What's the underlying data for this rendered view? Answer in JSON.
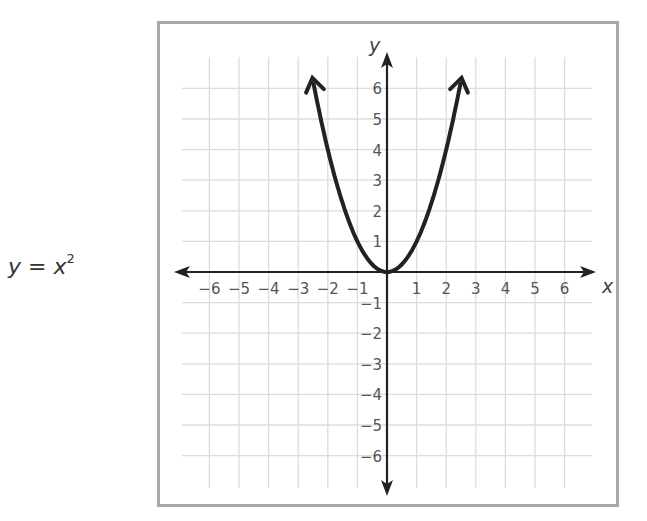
{
  "equation": {
    "lhs": "y",
    "eq": " = ",
    "rhs": "x",
    "exp": "2"
  },
  "chart_data": {
    "type": "line",
    "xlabel": "x",
    "ylabel": "y",
    "xlim": [
      -6,
      6
    ],
    "ylim": [
      -6,
      6
    ],
    "grid": true,
    "x_ticks": [
      -6,
      -5,
      -4,
      -3,
      -2,
      -1,
      1,
      2,
      3,
      4,
      5,
      6
    ],
    "y_ticks": [
      -6,
      -5,
      -4,
      -3,
      -2,
      -1,
      1,
      2,
      3,
      4,
      5,
      6
    ],
    "x_tick_labels": [
      "−6",
      "−5",
      "−4",
      "−3",
      "−2",
      "−1",
      "1",
      "2",
      "3",
      "4",
      "5",
      "6"
    ],
    "y_tick_labels": [
      "−6",
      "−5",
      "−4",
      "−3",
      "−2",
      "−1",
      "1",
      "2",
      "3",
      "4",
      "5",
      "6"
    ],
    "series": [
      {
        "name": "y = x^2",
        "x": [
          -2.5,
          -2,
          -1.5,
          -1,
          -0.5,
          0,
          0.5,
          1,
          1.5,
          2,
          2.5
        ],
        "y": [
          6.25,
          4,
          2.25,
          1,
          0.25,
          0,
          0.25,
          1,
          2.25,
          4,
          6.25
        ],
        "arrows_at_ends": true
      }
    ],
    "colors": {
      "curve": "#222222",
      "axes": "#222222",
      "grid": "#dcdcdc",
      "frame": "#a8a8a8"
    }
  }
}
